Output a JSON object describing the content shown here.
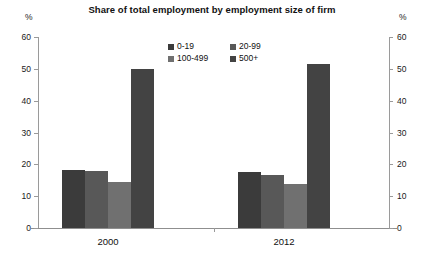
{
  "chart_data": {
    "type": "bar",
    "title": "Share of total employment by employment size of firm",
    "xlabel": "",
    "ylabel": "%",
    "ylabel_right": "%",
    "ylim": [
      0,
      60
    ],
    "yticks": [
      0,
      10,
      20,
      30,
      40,
      50,
      60
    ],
    "ytick_labels": [
      "0",
      "10",
      "20",
      "30",
      "40",
      "50",
      "60"
    ],
    "grid": false,
    "legend_position": "top-center",
    "categories": [
      "2000",
      "2012"
    ],
    "series": [
      {
        "name": "0-19",
        "color": "#3b3b3b",
        "values": [
          18.1,
          17.5
        ]
      },
      {
        "name": "20-99",
        "color": "#585858",
        "values": [
          17.9,
          16.6
        ]
      },
      {
        "name": "100-499",
        "color": "#707070",
        "values": [
          14.4,
          13.8
        ]
      },
      {
        "name": "500+",
        "color": "#434343",
        "values": [
          49.9,
          51.6
        ]
      }
    ]
  },
  "axes": {
    "unit_left": "%",
    "unit_right": "%"
  }
}
